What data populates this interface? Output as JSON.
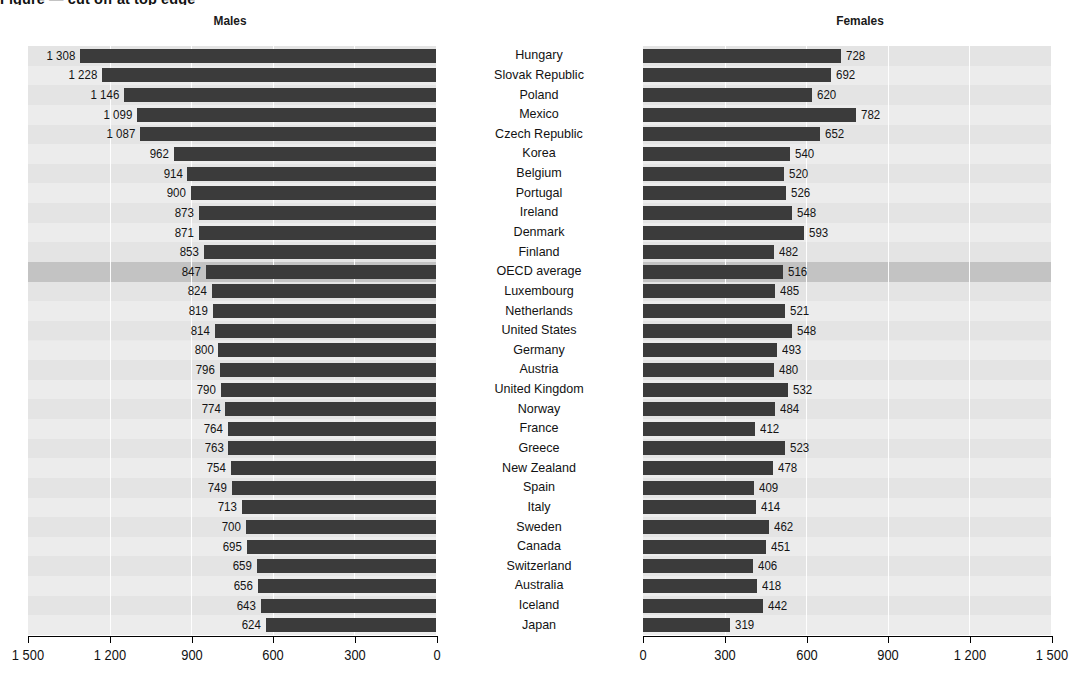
{
  "figure": {
    "title_fragment": "Figure — cut off at top edge",
    "left_panel_label": "Males",
    "right_panel_label": "Females"
  },
  "axis": {
    "left_ticks": [
      "1 500",
      "1 200",
      "900",
      "600",
      "300",
      "0"
    ],
    "right_ticks": [
      "0",
      "300",
      "600",
      "900",
      "1 200",
      "1 500"
    ],
    "min": 0,
    "max": 1500,
    "left_reversed": true
  },
  "colors": {
    "bar": "#3b3b3b",
    "plot_bg": "#e9e9e9",
    "row_alt": "#ececec",
    "highlight_row": "#c3c3c3",
    "gridline": "#ffffff",
    "text": "#141414"
  },
  "chart_data": {
    "type": "bar",
    "xlabel": "",
    "ylabel": "",
    "ylim": [
      0,
      1500
    ],
    "grid": true,
    "legend": "none",
    "orientation": "horizontal",
    "layout": "back-to-back (diverging) paired panels; left axis reversed",
    "categories": [
      "Hungary",
      "Slovak Republic",
      "Poland",
      "Mexico",
      "Czech Republic",
      "Korea",
      "Belgium",
      "Portugal",
      "Ireland",
      "Denmark",
      "Finland",
      "OECD average",
      "Luxembourg",
      "Netherlands",
      "United States",
      "Germany",
      "Austria",
      "United Kingdom",
      "Norway",
      "France",
      "Greece",
      "New Zealand",
      "Spain",
      "Italy",
      "Sweden",
      "Canada",
      "Switzerland",
      "Australia",
      "Iceland",
      "Japan"
    ],
    "highlight_category": "OECD average",
    "series": [
      {
        "name": "Males",
        "panel": "left",
        "values": [
          1308,
          1228,
          1146,
          1099,
          1087,
          962,
          914,
          900,
          873,
          871,
          853,
          847,
          824,
          819,
          814,
          800,
          796,
          790,
          774,
          764,
          763,
          754,
          749,
          713,
          700,
          695,
          659,
          656,
          643,
          624
        ],
        "labels": [
          "1 308",
          "1 228",
          "1 146",
          "1 099",
          "1 087",
          "962",
          "914",
          "900",
          "873",
          "871",
          "853",
          "847",
          "824",
          "819",
          "814",
          "800",
          "796",
          "790",
          "774",
          "764",
          "763",
          "754",
          "749",
          "713",
          "700",
          "695",
          "659",
          "656",
          "643",
          "624"
        ]
      },
      {
        "name": "Females",
        "panel": "right",
        "values": [
          728,
          692,
          620,
          782,
          652,
          540,
          520,
          526,
          548,
          593,
          482,
          516,
          485,
          521,
          548,
          493,
          480,
          532,
          484,
          412,
          523,
          478,
          409,
          414,
          462,
          451,
          406,
          418,
          442,
          319
        ],
        "labels": [
          "728",
          "692",
          "620",
          "782",
          "652",
          "540",
          "520",
          "526",
          "548",
          "593",
          "482",
          "516",
          "485",
          "521",
          "548",
          "493",
          "480",
          "532",
          "484",
          "412",
          "523",
          "478",
          "409",
          "414",
          "462",
          "451",
          "406",
          "418",
          "442",
          "319"
        ]
      }
    ]
  }
}
